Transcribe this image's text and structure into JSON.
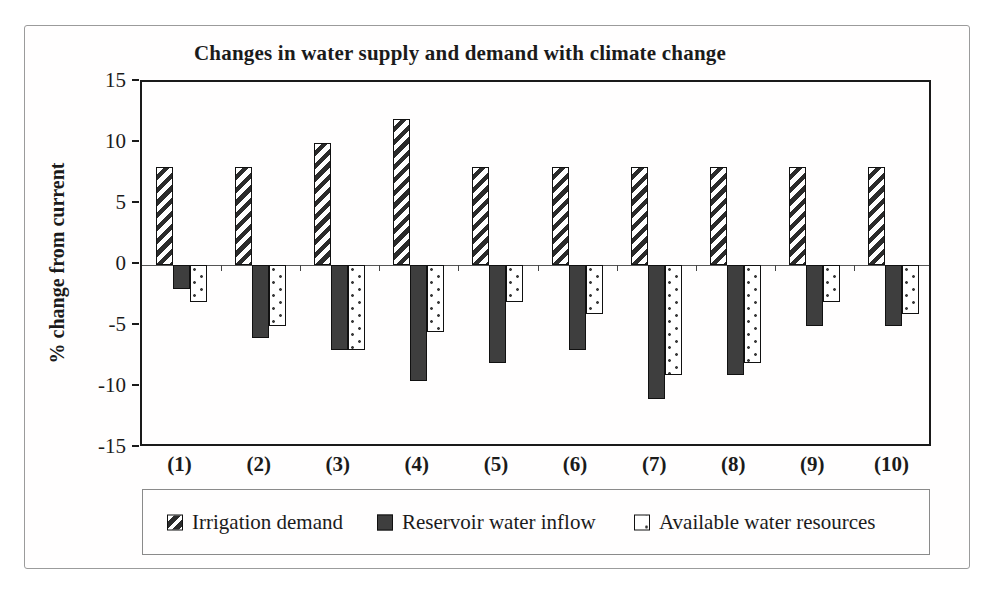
{
  "figure": {
    "background": "#ffffff",
    "frame_border_color": "#9b9b9b",
    "plot_border_color": "#1a1a1a",
    "text_color": "#1b1b1b",
    "dark_bar_color": "#3e3e3e",
    "hatch_stripe_color": "#2b2b2b"
  },
  "chart_data": {
    "type": "bar",
    "title": "Changes in water supply and demand with climate change",
    "ylabel": "% change from current",
    "xlabel": "",
    "categories": [
      "(1)",
      "(2)",
      "(3)",
      "(4)",
      "(5)",
      "(6)",
      "(7)",
      "(8)",
      "(9)",
      "(10)"
    ],
    "series": [
      {
        "name": "Irrigation demand",
        "pattern": "diagonal-hatch",
        "values": [
          8,
          8,
          10,
          12,
          8,
          8,
          8,
          8,
          8,
          8
        ]
      },
      {
        "name": "Reservoir water inflow",
        "pattern": "solid-dark",
        "color": "#3e3e3e",
        "values": [
          -2,
          -6,
          -7,
          -9.5,
          -8,
          -7,
          -11,
          -9,
          -5,
          -5
        ]
      },
      {
        "name": "Available water resources",
        "pattern": "dotted",
        "values": [
          -3,
          -5,
          -7,
          -5.5,
          -3,
          -4,
          -9,
          -8,
          -3,
          -4
        ]
      }
    ],
    "ylim": [
      -15,
      15
    ],
    "ytick_step": 5,
    "yticks": [
      15,
      10,
      5,
      0,
      -5,
      -10,
      -15
    ],
    "grid": false,
    "legend_position": "bottom"
  }
}
